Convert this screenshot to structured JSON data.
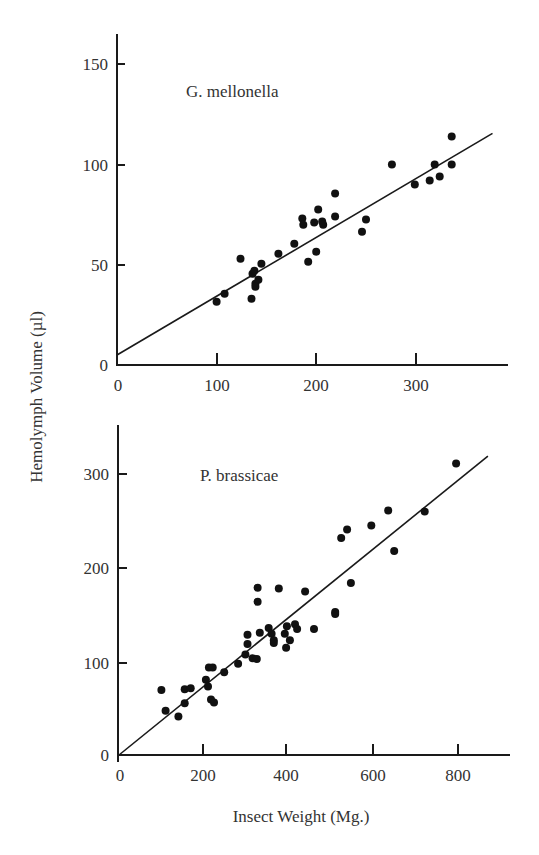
{
  "chart_data": [
    {
      "type": "scatter",
      "title": "G. mellonella",
      "xlabel": "",
      "ylabel": "Hemolymph Volume (µl)",
      "xlim": [
        0,
        390
      ],
      "ylim": [
        0,
        160
      ],
      "xticks": [
        0,
        100,
        200,
        300
      ],
      "yticks": [
        0,
        50,
        100,
        150
      ],
      "grid": false,
      "series": [
        {
          "name": "G. mellonella",
          "points": [
            [
              100,
              31.5
            ],
            [
              108,
              35.5
            ],
            [
              124,
              53
            ],
            [
              135,
              33
            ],
            [
              136,
              45.5
            ],
            [
              138,
              47
            ],
            [
              139,
              40.5
            ],
            [
              142,
              42.5
            ],
            [
              139,
              39
            ],
            [
              145,
              50.5
            ],
            [
              162,
              55.5
            ],
            [
              178,
              60.5
            ],
            [
              186,
              73
            ],
            [
              187,
              70
            ],
            [
              192,
              51.5
            ],
            [
              198,
              71
            ],
            [
              200,
              56.5
            ],
            [
              202,
              77.5
            ],
            [
              206,
              71.5
            ],
            [
              207,
              70
            ],
            [
              219,
              74
            ],
            [
              219,
              85.5
            ],
            [
              246,
              66.5
            ],
            [
              250,
              72.5
            ],
            [
              276,
              100
            ],
            [
              299,
              90
            ],
            [
              314,
              92
            ],
            [
              319,
              100
            ],
            [
              324,
              94
            ],
            [
              336,
              114
            ],
            [
              336,
              100
            ]
          ]
        }
      ],
      "fit_line": {
        "x": [
          0,
          377
        ],
        "y": [
          5,
          115.5
        ]
      }
    },
    {
      "type": "scatter",
      "title": "P. brassicae",
      "xlabel": "Insect Weight (Mg.)",
      "ylabel": "Hemolymph Volume (µl)",
      "xlim": [
        0,
        920
      ],
      "ylim": [
        0,
        350
      ],
      "xticks": [
        0,
        200,
        400,
        600,
        800
      ],
      "yticks": [
        0,
        100,
        200,
        300
      ],
      "grid": false,
      "series": [
        {
          "name": "P. brassicae",
          "points": [
            [
              100,
              69
            ],
            [
              110,
              47
            ],
            [
              140,
              41
            ],
            [
              155,
              55
            ],
            [
              155,
              70
            ],
            [
              169,
              71
            ],
            [
              205,
              80
            ],
            [
              210,
              73
            ],
            [
              212,
              93
            ],
            [
              221,
              93
            ],
            [
              217,
              59
            ],
            [
              224,
              56
            ],
            [
              248,
              88
            ],
            [
              281,
              97
            ],
            [
              298,
              107
            ],
            [
              303,
              118
            ],
            [
              303,
              128
            ],
            [
              315,
              103
            ],
            [
              325,
              102
            ],
            [
              327,
              163
            ],
            [
              327,
              178
            ],
            [
              332,
              130
            ],
            [
              353,
              135
            ],
            [
              360,
              129
            ],
            [
              365,
              122
            ],
            [
              365,
              119
            ],
            [
              377,
              177
            ],
            [
              391,
              129
            ],
            [
              394,
              114
            ],
            [
              396,
              137
            ],
            [
              403,
              122
            ],
            [
              415,
              139
            ],
            [
              420,
              134
            ],
            [
              439,
              174
            ],
            [
              460,
              134
            ],
            [
              510,
              152
            ],
            [
              510,
              150
            ],
            [
              524,
              231
            ],
            [
              538,
              240
            ],
            [
              547,
              183
            ],
            [
              595,
              244
            ],
            [
              635,
              260
            ],
            [
              649,
              217
            ],
            [
              721,
              259
            ],
            [
              795,
              310
            ]
          ]
        }
      ],
      "fit_line": {
        "x": [
          0,
          870
        ],
        "y": [
          0,
          318
        ]
      }
    }
  ],
  "labels": {
    "top_species": "G. mellonella",
    "bottom_species": "P. brassicae",
    "y_axis_title": "Hemolymph Volume (µl)",
    "x_axis_title": "Insect Weight (Mg.)",
    "top_yticks": [
      "150",
      "100",
      "50",
      "0"
    ],
    "top_xticks": [
      "0",
      "100",
      "200",
      "300"
    ],
    "bottom_yticks": [
      "300",
      "200",
      "100",
      "0"
    ],
    "bottom_xticks": [
      "0",
      "200",
      "400",
      "600",
      "800"
    ]
  }
}
